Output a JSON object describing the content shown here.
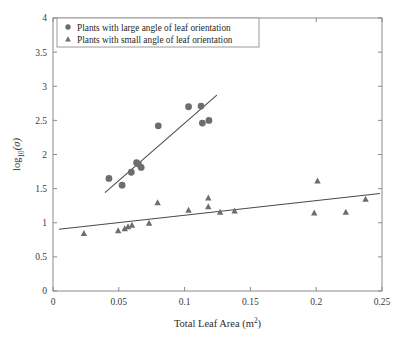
{
  "chart_data": {
    "type": "scatter",
    "title": "",
    "xlabel": "Total Leaf Area (m²)",
    "ylabel": "log₁₀(σ)",
    "xlim": [
      0,
      0.25
    ],
    "ylim": [
      0,
      4
    ],
    "xticks": [
      0,
      0.05,
      0.1,
      0.15,
      0.2,
      0.25
    ],
    "xticklabels": [
      "0",
      "0.05",
      "0.1",
      "0.15",
      "0.2",
      "0.25"
    ],
    "yticks": [
      0,
      0.5,
      1,
      1.5,
      2,
      2.5,
      3,
      3.5,
      4
    ],
    "yticklabels": [
      "0",
      "0.5",
      "1",
      "1.5",
      "2",
      "2.5",
      "3",
      "3.5",
      "4"
    ],
    "grid": false,
    "legend_position": "upper-left",
    "marker_color": "#6d6d6d",
    "line_color": "#4a4a4a",
    "series": [
      {
        "name": "Plants with large angle of leaf orientation",
        "marker": "circle",
        "color": "#6d6d6d",
        "points": [
          {
            "x": 0.0425,
            "y": 1.65
          },
          {
            "x": 0.0525,
            "y": 1.55
          },
          {
            "x": 0.0595,
            "y": 1.74
          },
          {
            "x": 0.0635,
            "y": 1.88
          },
          {
            "x": 0.065,
            "y": 1.86
          },
          {
            "x": 0.067,
            "y": 1.81
          },
          {
            "x": 0.08,
            "y": 2.42
          },
          {
            "x": 0.103,
            "y": 2.7
          },
          {
            "x": 0.1125,
            "y": 2.71
          },
          {
            "x": 0.1135,
            "y": 2.46
          },
          {
            "x": 0.1185,
            "y": 2.5
          }
        ],
        "trend": {
          "x1": 0.0395,
          "y1": 1.44,
          "x2": 0.1245,
          "y2": 2.87
        }
      },
      {
        "name": "Plants with small angle of leaf orientation",
        "marker": "triangle",
        "color": "#6d6d6d",
        "points": [
          {
            "x": 0.0235,
            "y": 0.84
          },
          {
            "x": 0.0495,
            "y": 0.88
          },
          {
            "x": 0.0545,
            "y": 0.91
          },
          {
            "x": 0.057,
            "y": 0.94
          },
          {
            "x": 0.06,
            "y": 0.96
          },
          {
            "x": 0.073,
            "y": 0.99
          },
          {
            "x": 0.0795,
            "y": 1.29
          },
          {
            "x": 0.103,
            "y": 1.18
          },
          {
            "x": 0.118,
            "y": 1.36
          },
          {
            "x": 0.118,
            "y": 1.23
          },
          {
            "x": 0.127,
            "y": 1.15
          },
          {
            "x": 0.138,
            "y": 1.17
          },
          {
            "x": 0.1985,
            "y": 1.14
          },
          {
            "x": 0.201,
            "y": 1.61
          },
          {
            "x": 0.2225,
            "y": 1.15
          },
          {
            "x": 0.2375,
            "y": 1.34
          }
        ],
        "trend": {
          "x1": 0.0045,
          "y1": 0.905,
          "x2": 0.2485,
          "y2": 1.43
        }
      }
    ]
  },
  "legend": {
    "entries": [
      {
        "marker": "circle",
        "label": "Plants with large angle of leaf orientation"
      },
      {
        "marker": "triangle",
        "label": "Plants with small angle of leaf orientation"
      }
    ]
  }
}
